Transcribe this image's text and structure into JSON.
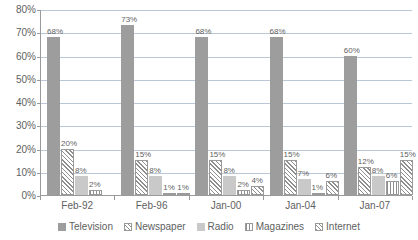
{
  "chart_data": {
    "type": "bar",
    "title": "",
    "xlabel": "",
    "ylabel": "",
    "ylim": [
      0,
      80
    ],
    "ytick_labels": [
      "80%",
      "70%",
      "60%",
      "50%",
      "40%",
      "30%",
      "20%",
      "10%",
      "0%"
    ],
    "ytick_values": [
      80,
      70,
      60,
      50,
      40,
      30,
      20,
      10,
      0
    ],
    "grid": true,
    "legend_position": "bottom",
    "categories": [
      "Feb-92",
      "Feb-96",
      "Jan-00",
      "Jan-04",
      "Jan-07"
    ],
    "series": [
      {
        "name": "Television",
        "key": "television",
        "values": [
          68,
          73,
          68,
          68,
          60
        ],
        "labels": [
          "68%",
          "73%",
          "68%",
          "68%",
          "60%"
        ]
      },
      {
        "name": "Newspaper",
        "key": "newspaper",
        "values": [
          20,
          15,
          15,
          15,
          12
        ],
        "labels": [
          "20%",
          "15%",
          "15%",
          "15%",
          "12%"
        ]
      },
      {
        "name": "Radio",
        "key": "radio",
        "values": [
          8,
          8,
          8,
          7,
          8
        ],
        "labels": [
          "8%",
          "8%",
          "8%",
          "7%",
          "8%"
        ]
      },
      {
        "name": "Magazines",
        "key": "magazines",
        "values": [
          2,
          1,
          2,
          1,
          6
        ],
        "labels": [
          "2%",
          "1%",
          "2%",
          "1%",
          "6%"
        ]
      },
      {
        "name": "Internet",
        "key": "internet",
        "values": [
          null,
          1,
          4,
          6,
          15
        ],
        "labels": [
          "",
          "1%",
          "4%",
          "6%",
          "15%"
        ]
      }
    ],
    "colors": {
      "television": "#9d9d9d",
      "newspaper": "#8f8f8f",
      "radio": "#c9c9c9",
      "magazines": "#8f8f8f",
      "internet": "#8f8f8f",
      "gridline": "#b9c7d6",
      "axis": "#9a9a9a",
      "text": "#5f5f5f"
    }
  },
  "legend": {
    "items": [
      {
        "label": "Television",
        "key": "television"
      },
      {
        "label": "Newspaper",
        "key": "newspaper"
      },
      {
        "label": "Radio",
        "key": "radio"
      },
      {
        "label": "Magazines",
        "key": "magazines"
      },
      {
        "label": "Internet",
        "key": "internet"
      }
    ]
  }
}
